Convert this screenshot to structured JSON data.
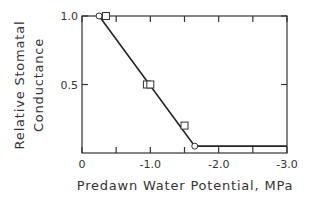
{
  "chart_data": {
    "type": "line",
    "title": "",
    "xlabel": "Predawn Water Potential, MPa",
    "ylabel_line1": "Relative Stomatal",
    "ylabel_line2": "Conductance",
    "xlim": [
      0,
      -3.0
    ],
    "ylim": [
      0,
      1.0
    ],
    "x_ticks": [
      0,
      -0.5,
      -1.0,
      -1.5,
      -2.0,
      -2.5,
      -3.0
    ],
    "x_tick_labels": [
      "0",
      "-1.0",
      "-2.0",
      "-3.0"
    ],
    "y_tick_labels": [
      "1.0",
      "0.5"
    ],
    "grid": false,
    "series": [
      {
        "name": "fit line",
        "type": "line",
        "x": [
          -0.25,
          -1.65,
          -3.0
        ],
        "y": [
          1.0,
          0.05,
          0.05
        ]
      },
      {
        "name": "circles",
        "type": "scatter",
        "marker": "circle",
        "x": [
          -0.25,
          -1.65
        ],
        "y": [
          1.0,
          0.05
        ]
      },
      {
        "name": "squares",
        "type": "scatter",
        "marker": "square",
        "x": [
          -0.35,
          -0.95,
          -1.0,
          -1.5
        ],
        "y": [
          1.0,
          0.5,
          0.5,
          0.2
        ]
      }
    ]
  }
}
